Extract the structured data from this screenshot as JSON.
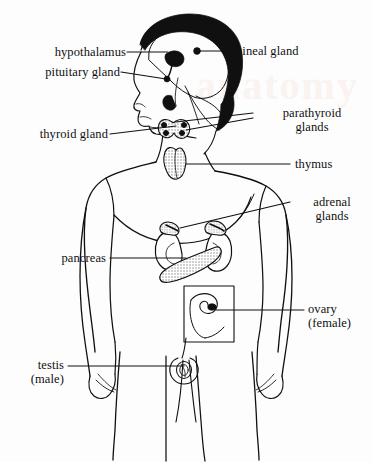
{
  "figure": {
    "background_color": "#fdfdfd",
    "ink_color": "#101010",
    "stipple_color": "#b4b4b4",
    "watermark_text": "anatomy"
  },
  "labels": {
    "hypothalamus": "hypothalamus",
    "pituitary_gland": "pituitary gland",
    "pineal_gland": "pineal gland",
    "thyroid_gland": "thyroid gland",
    "parathyroid_glands": "parathyroid\nglands",
    "thymus": "thymus",
    "adrenal_glands": "adrenal\nglands",
    "pancreas": "pancreas",
    "ovary": "ovary\n(female)",
    "testis": "testis\n(male)"
  },
  "structures": [
    {
      "name": "hypothalamus",
      "label": "hypothalamus",
      "side": "left",
      "region": "brain"
    },
    {
      "name": "pituitary-gland",
      "label": "pituitary gland",
      "side": "left",
      "region": "brain"
    },
    {
      "name": "pineal-gland",
      "label": "pineal gland",
      "side": "right",
      "region": "brain"
    },
    {
      "name": "thyroid-gland",
      "label": "thyroid gland",
      "side": "left",
      "region": "neck"
    },
    {
      "name": "parathyroid-glands",
      "label": "parathyroid glands",
      "side": "right",
      "region": "neck"
    },
    {
      "name": "thymus",
      "label": "thymus",
      "side": "right",
      "region": "chest"
    },
    {
      "name": "adrenal-glands",
      "label": "adrenal glands",
      "side": "right",
      "region": "abdomen"
    },
    {
      "name": "pancreas",
      "label": "pancreas",
      "side": "left",
      "region": "abdomen"
    },
    {
      "name": "ovary",
      "label": "ovary (female)",
      "side": "right",
      "region": "pelvis"
    },
    {
      "name": "testis",
      "label": "testis (male)",
      "side": "left",
      "region": "pelvis"
    }
  ]
}
